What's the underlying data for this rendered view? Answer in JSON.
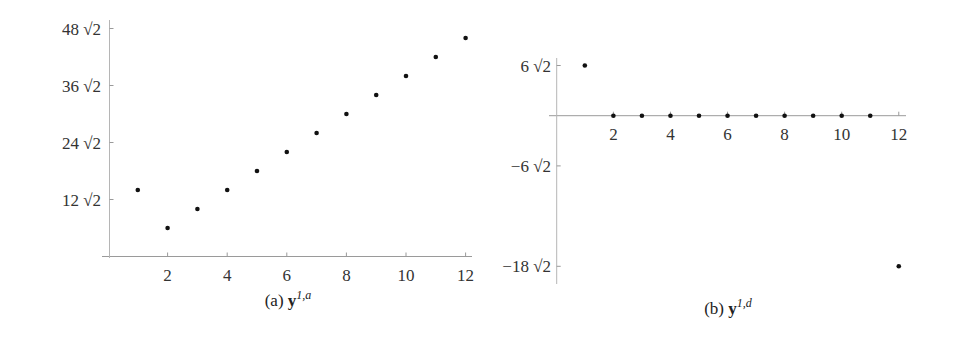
{
  "chart_data": [
    {
      "type": "scatter",
      "title": "",
      "caption_prefix": "(a)",
      "caption_symbol": "y",
      "caption_superscript": "1,a",
      "xlabel": "",
      "ylabel": "",
      "x_ticks": [
        2,
        4,
        6,
        8,
        10,
        12
      ],
      "y_ticks": [
        {
          "value": 12,
          "label": "12 √2"
        },
        {
          "value": 24,
          "label": "24 √2"
        },
        {
          "value": 36,
          "label": "36 √2"
        },
        {
          "value": 48,
          "label": "48 √2"
        }
      ],
      "y_unit": "√2",
      "xlim": [
        0,
        12.3
      ],
      "ylim": [
        0,
        49
      ],
      "grid": false,
      "legend": null,
      "x": [
        1,
        2,
        3,
        4,
        5,
        6,
        7,
        8,
        9,
        10,
        11,
        12
      ],
      "values": [
        14,
        6,
        10,
        14,
        18,
        22,
        26,
        30,
        34,
        38,
        42,
        46
      ]
    },
    {
      "type": "scatter",
      "title": "",
      "caption_prefix": "(b)",
      "caption_symbol": "y",
      "caption_superscript": "1,d",
      "xlabel": "",
      "ylabel": "",
      "x_ticks": [
        2,
        4,
        6,
        8,
        10,
        12
      ],
      "y_ticks": [
        {
          "value": 6,
          "label": "6 √2"
        },
        {
          "value": -6,
          "label": "−6 √2"
        },
        {
          "value": -18,
          "label": "−18 √2"
        }
      ],
      "y_unit": "√2",
      "xlim": [
        0,
        12.3
      ],
      "ylim": [
        -19.5,
        8.5
      ],
      "grid": false,
      "legend": null,
      "x": [
        1,
        2,
        3,
        4,
        5,
        6,
        7,
        8,
        9,
        10,
        11,
        12
      ],
      "values": [
        6,
        0,
        0,
        0,
        0,
        0,
        0,
        0,
        0,
        0,
        0,
        -18
      ]
    }
  ]
}
